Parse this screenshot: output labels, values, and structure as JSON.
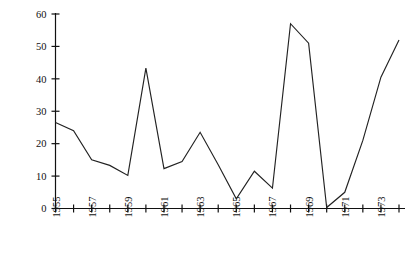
{
  "chart_data": {
    "type": "line",
    "title": "",
    "xlabel": "",
    "ylabel": "Percentage of strikers",
    "x": [
      1955,
      1956,
      1957,
      1958,
      1959,
      1960,
      1961,
      1962,
      1963,
      1964,
      1965,
      1966,
      1967,
      1968,
      1969,
      1970,
      1971,
      1972,
      1973,
      1974
    ],
    "values": [
      26.5,
      24.0,
      15.0,
      13.3,
      10.2,
      43.3,
      12.3,
      14.5,
      23.5,
      13.5,
      3.0,
      11.5,
      6.3,
      57.0,
      51.0,
      0.3,
      5.0,
      21.0,
      40.5,
      52.0
    ],
    "series": [
      {
        "name": "Percentage of strikers",
        "values": [
          26.5,
          24.0,
          15.0,
          13.3,
          10.2,
          43.3,
          12.3,
          14.5,
          23.5,
          13.5,
          3.0,
          11.5,
          6.3,
          57.0,
          51.0,
          0.3,
          5.0,
          21.0,
          40.5,
          52.0
        ]
      }
    ],
    "xlim": [
      1955,
      1974
    ],
    "ylim": [
      0,
      60
    ],
    "y_ticks": [
      0,
      10,
      20,
      30,
      40,
      50,
      60
    ],
    "y_tick_labels": [
      "0",
      "10",
      "20",
      "30",
      "40",
      "50",
      "60"
    ],
    "x_ticks": [
      1955,
      1956,
      1957,
      1958,
      1959,
      1960,
      1961,
      1962,
      1963,
      1964,
      1965,
      1966,
      1967,
      1968,
      1969,
      1970,
      1971,
      1972,
      1973,
      1974
    ],
    "x_tick_labels": [
      "1955",
      "",
      "1957",
      "",
      "1959",
      "",
      "1961",
      "",
      "1963",
      "",
      "1965",
      "",
      "1967",
      "",
      "1969",
      "",
      "1971",
      "",
      "1973",
      ""
    ],
    "grid": false,
    "legend": false,
    "legend_position": "none",
    "line_color": "#222222",
    "background_color": "#ffffff",
    "axis_color": "#111111"
  },
  "axes": {
    "y_label_text": "Percentage of strikers",
    "y_ticks": [
      "60",
      "50",
      "40",
      "30",
      "20",
      "10",
      "0"
    ],
    "x_ticks": [
      "1955",
      "1957",
      "1959",
      "1961",
      "1963",
      "1965",
      "1967",
      "1969",
      "1971",
      "1973"
    ]
  },
  "header": {
    "title": ""
  }
}
